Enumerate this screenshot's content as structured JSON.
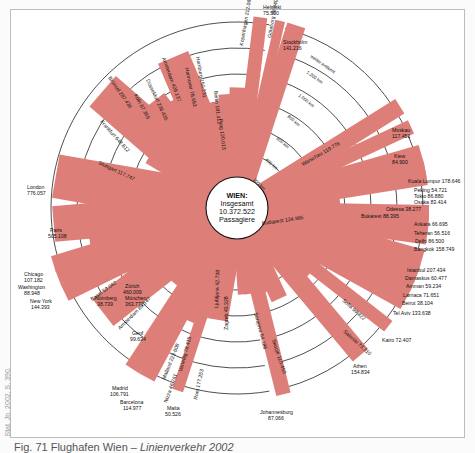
{
  "figure": {
    "caption_number": "Fig. 71",
    "caption_title": "Flughafen Wien –",
    "caption_subtitle": "Linienverkehr 2002",
    "source": "Stat. Jb. 2002, S. 390.",
    "center_title": "WIEN:",
    "center_line2": "Insgesamt",
    "center_total": "10.372.522",
    "center_line4": "Passagiere",
    "bar_color": "#dd7f78"
  },
  "chart_data": {
    "type": "radial-bar",
    "title": "Flughafen Wien – Linienverkehr 2002",
    "center": {
      "city": "WIEN",
      "label": "Insgesamt",
      "total_passengers": 10372522
    },
    "distance_rings_km": [
      200,
      400,
      600,
      800,
      1000,
      1200
    ],
    "ring_labels": [
      "200 km",
      "400 km",
      "600 km",
      "800 km",
      "1.000 km",
      "1.200 km",
      "weiter entfernt"
    ],
    "value_label": "Passagiere",
    "destinations": [
      {
        "city": "Helsinki",
        "passengers": 75500,
        "angle": 83
      },
      {
        "city": "Göteborg",
        "passengers": 38840,
        "angle": 77
      },
      {
        "city": "Stockholm",
        "passengers": 141216,
        "angle": 72
      },
      {
        "city": "Kopenhagen",
        "passengers": 212067,
        "angle": 88
      },
      {
        "city": "Berlin",
        "passengers": 181412,
        "angle": 94
      },
      {
        "city": "Prag",
        "passengers": 120013,
        "angle": 99
      },
      {
        "city": "Hamburg",
        "passengers": 150231,
        "angle": 104
      },
      {
        "city": "Hannover",
        "passengers": 78693,
        "angle": 107
      },
      {
        "city": "Amsterdam",
        "passengers": 428137,
        "angle": 113
      },
      {
        "city": "Düsseldorf",
        "passengers": 236435,
        "angle": 119
      },
      {
        "city": "Köln",
        "passengers": 87365,
        "angle": 123
      },
      {
        "city": "Brüssel",
        "passengers": 287436,
        "angle": 128
      },
      {
        "city": "Frankfurt",
        "passengers": 648612,
        "angle": 139
      },
      {
        "city": "Stuttgart",
        "passengers": 117747,
        "angle": 149
      },
      {
        "city": "London",
        "passengers": 776057,
        "angle": 170
      },
      {
        "city": "Paris",
        "passengers": 505108,
        "angle": 185
      },
      {
        "city": "Nürnberg",
        "passengers": 38739,
        "angle": 193
      },
      {
        "city": "München",
        "passengers": 363771,
        "angle": 190
      },
      {
        "city": "Chicago",
        "passengers": 107182,
        "angle": 197
      },
      {
        "city": "Washington",
        "passengers": 88948,
        "angle": 201
      },
      {
        "city": "New York",
        "passengers": 144393,
        "angle": 206
      },
      {
        "city": "Basel",
        "passengers": 59042,
        "angle": 210
      },
      {
        "city": "Zürich",
        "passengers": 460009,
        "angle": 218
      },
      {
        "city": "Amsterdam",
        "passengers": 89547,
        "angle": 224
      },
      {
        "city": "Genf",
        "passengers": 99634,
        "angle": 229
      },
      {
        "city": "Madrid",
        "passengers": 106791,
        "angle": 237
      },
      {
        "city": "Barcelona",
        "passengers": 114977,
        "angle": 242
      },
      {
        "city": "Mailand",
        "passengers": 223608,
        "angle": 246
      },
      {
        "city": "Nizza",
        "passengers": 46761,
        "angle": 249
      },
      {
        "city": "Malta",
        "passengers": 50526,
        "angle": 252
      },
      {
        "city": "Venedig",
        "passengers": 78415,
        "angle": 256
      },
      {
        "city": "Rom",
        "passengers": 177253,
        "angle": 260
      },
      {
        "city": "Ljubljana",
        "passengers": 42738,
        "angle": 274
      },
      {
        "city": "Zagreb",
        "passengers": 43328,
        "angle": 279
      },
      {
        "city": "Johannesburg",
        "passengers": 87066,
        "angle": 284
      },
      {
        "city": "Sarajevo",
        "passengers": 54186,
        "angle": 289
      },
      {
        "city": "Skopje",
        "passengers": 110450,
        "angle": 295
      },
      {
        "city": "Athen",
        "passengers": 154834,
        "angle": 310
      },
      {
        "city": "Saloniki",
        "passengers": 73310,
        "angle": 314
      },
      {
        "city": "Sofia",
        "passengers": 99822,
        "angle": 319
      },
      {
        "city": "Kairo",
        "passengers": 72407,
        "angle": 322
      },
      {
        "city": "Tel Aviv",
        "passengers": 133638,
        "angle": 331
      },
      {
        "city": "Beirut",
        "passengers": 38104,
        "angle": 334
      },
      {
        "city": "Larnaca",
        "passengers": 71651,
        "angle": 336
      },
      {
        "city": "Amman",
        "passengers": 59234,
        "angle": 339
      },
      {
        "city": "Damaskus",
        "passengers": 60477,
        "angle": 341
      },
      {
        "city": "Istanbul",
        "passengers": 207434,
        "angle": 344
      },
      {
        "city": "Bangkok",
        "passengers": 158749,
        "angle": 352
      },
      {
        "city": "Delhi",
        "passengers": 86500,
        "angle": 355
      },
      {
        "city": "Teheran",
        "passengers": 56516,
        "angle": 357
      },
      {
        "city": "Ankara",
        "passengers": 66695,
        "angle": 359
      },
      {
        "city": "Bukarest",
        "passengers": 88395,
        "angle": 3
      },
      {
        "city": "Budapest",
        "passengers": 124985,
        "angle": 7
      },
      {
        "city": "Odessa",
        "passengers": 38277,
        "angle": 5
      },
      {
        "city": "Osaka",
        "passengers": 83414,
        "angle": 9
      },
      {
        "city": "Tokio",
        "passengers": 86880,
        "angle": 11
      },
      {
        "city": "Peking",
        "passengers": 54721,
        "angle": 13
      },
      {
        "city": "Kuala Lumpur",
        "passengers": 178646,
        "angle": 16
      },
      {
        "city": "Kiew",
        "passengers": 84900,
        "angle": 25
      },
      {
        "city": "Warschau",
        "passengers": 119776,
        "angle": 32
      },
      {
        "city": "Moskau",
        "passengers": 117451,
        "angle": 32
      }
    ]
  },
  "labels": [
    {
      "t": "Helsinki",
      "x": 263,
      "y": 9
    },
    {
      "t": "75.500",
      "x": 263,
      "y": 15
    },
    {
      "t": "Stockholm",
      "x": 283,
      "y": 44
    },
    {
      "t": "141.216",
      "x": 283,
      "y": 50
    },
    {
      "t": "London",
      "x": 27,
      "y": 189
    },
    {
      "t": "776.057",
      "x": 27,
      "y": 195
    },
    {
      "t": "Paris",
      "x": 50,
      "y": 232
    },
    {
      "t": "505.108",
      "x": 48,
      "y": 238
    },
    {
      "t": "Nürnberg",
      "x": 95,
      "y": 300
    },
    {
      "t": "38.739",
      "x": 97,
      "y": 306
    },
    {
      "t": "München",
      "x": 125,
      "y": 300
    },
    {
      "t": "363.771",
      "x": 125,
      "y": 306
    },
    {
      "t": "Chicago",
      "x": 24,
      "y": 276
    },
    {
      "t": "107.182",
      "x": 24,
      "y": 282
    },
    {
      "t": "Washington",
      "x": 18,
      "y": 289
    },
    {
      "t": "88.948",
      "x": 24,
      "y": 295
    },
    {
      "t": "New York",
      "x": 30,
      "y": 303
    },
    {
      "t": "144.393",
      "x": 31,
      "y": 309
    },
    {
      "t": "Zürich",
      "x": 125,
      "y": 288
    },
    {
      "t": "460.009",
      "x": 123,
      "y": 294
    },
    {
      "t": "Genf",
      "x": 132,
      "y": 335
    },
    {
      "t": "99.634",
      "x": 130,
      "y": 341
    },
    {
      "t": "Madrid",
      "x": 112,
      "y": 390
    },
    {
      "t": "106.791",
      "x": 110,
      "y": 396
    },
    {
      "t": "Barcelona",
      "x": 120,
      "y": 404
    },
    {
      "t": "114.977",
      "x": 123,
      "y": 410
    },
    {
      "t": "Malta",
      "x": 167,
      "y": 410
    },
    {
      "t": "50.526",
      "x": 165,
      "y": 416
    },
    {
      "t": "Johannesburg",
      "x": 260,
      "y": 414
    },
    {
      "t": "87.066",
      "x": 268,
      "y": 420
    },
    {
      "t": "Athen",
      "x": 353,
      "y": 368
    },
    {
      "t": "154.834",
      "x": 351,
      "y": 374
    },
    {
      "t": "Kairo 72.407",
      "x": 382,
      "y": 342
    },
    {
      "t": "Tel Aviv 133.638",
      "x": 393,
      "y": 315
    },
    {
      "t": "Beirut 38.104",
      "x": 402,
      "y": 305
    },
    {
      "t": "Larnaca 71.651",
      "x": 403,
      "y": 297
    },
    {
      "t": "Amman 59.234",
      "x": 406,
      "y": 288
    },
    {
      "t": "Damaskus 60.477",
      "x": 405,
      "y": 280
    },
    {
      "t": "Istanbul 207.434",
      "x": 407,
      "y": 272
    },
    {
      "t": "Bangkok 158.749",
      "x": 414,
      "y": 251
    },
    {
      "t": "Delhi 86.500",
      "x": 415,
      "y": 243
    },
    {
      "t": "Teheran 56.516",
      "x": 414,
      "y": 235
    },
    {
      "t": "Ankara 66.695",
      "x": 414,
      "y": 226
    },
    {
      "t": "Bukarest 88.395",
      "x": 361,
      "y": 218
    },
    {
      "t": "Odessa 38.277",
      "x": 386,
      "y": 211
    },
    {
      "t": "Osaka 83.414",
      "x": 414,
      "y": 204
    },
    {
      "t": "Tokio 86.880",
      "x": 414,
      "y": 198
    },
    {
      "t": "Peking 54.721",
      "x": 414,
      "y": 192
    },
    {
      "t": "Kuala Lumpur 178.646",
      "x": 408,
      "y": 183
    },
    {
      "t": "Kiew",
      "x": 394,
      "y": 158
    },
    {
      "t": "84.900",
      "x": 392,
      "y": 164
    },
    {
      "t": "Moskau",
      "x": 392,
      "y": 132
    },
    {
      "t": "117.451",
      "x": 392,
      "y": 138
    }
  ],
  "rot_labels": [
    {
      "t": "Kopenhagen 212.067",
      "x": 243,
      "y": 46,
      "r": -80
    },
    {
      "t": "Göteborg 38.840",
      "x": 271,
      "y": 38,
      "r": -80
    },
    {
      "t": "Berlin 181.412",
      "x": 214,
      "y": 91,
      "r": 84
    },
    {
      "t": "Prag 120.013",
      "x": 219,
      "y": 119,
      "r": 84
    },
    {
      "t": "Hamburg 150.231",
      "x": 196,
      "y": 57,
      "r": 80
    },
    {
      "t": "Hannover 78.693",
      "x": 185,
      "y": 68,
      "r": 78
    },
    {
      "t": "Amsterdam 428.137",
      "x": 162,
      "y": 58,
      "r": 70
    },
    {
      "t": "Düsseldorf 236.435",
      "x": 146,
      "y": 80,
      "r": 65
    },
    {
      "t": "Köln 87.365",
      "x": 134,
      "y": 95,
      "r": 62
    },
    {
      "t": "Brüssel 287.436",
      "x": 108,
      "y": 78,
      "r": 55
    },
    {
      "t": "Frankfurt 648.612",
      "x": 100,
      "y": 122,
      "r": 48
    },
    {
      "t": "Stuttgart 117.747",
      "x": 98,
      "y": 164,
      "r": 25
    },
    {
      "t": "Basel 59.042",
      "x": 92,
      "y": 301,
      "r": -35
    },
    {
      "t": "Amsterdam 89.547",
      "x": 120,
      "y": 330,
      "r": -45
    },
    {
      "t": "Mailand 223.608",
      "x": 165,
      "y": 380,
      "r": -68
    },
    {
      "t": "Nizza 46.761",
      "x": 167,
      "y": 403,
      "r": -70
    },
    {
      "t": "Venedig 78.415",
      "x": 182,
      "y": 372,
      "r": -75
    },
    {
      "t": "Rom 177.253",
      "x": 197,
      "y": 400,
      "r": -78
    },
    {
      "t": "Ljubljana 42.738",
      "x": 218,
      "y": 308,
      "r": -88
    },
    {
      "t": "Zagreb 43.328",
      "x": 228,
      "y": 330,
      "r": -90
    },
    {
      "t": "Sarajevo 54.186",
      "x": 254,
      "y": 313,
      "r": 75
    },
    {
      "t": "Skopje 110.450",
      "x": 272,
      "y": 340,
      "r": 72
    },
    {
      "t": "Sofia 99.822",
      "x": 342,
      "y": 301,
      "r": 42
    },
    {
      "t": "Saloniki 73.310",
      "x": 343,
      "y": 332,
      "r": 42
    },
    {
      "t": "Budapest 124.985",
      "x": 262,
      "y": 225,
      "r": -8
    },
    {
      "t": "Warschau 119.776",
      "x": 303,
      "y": 166,
      "r": -30
    }
  ],
  "ring_text": [
    {
      "t": "weiter entfernt",
      "x": 310,
      "y": 57,
      "r": 35
    },
    {
      "t": "1.200 km",
      "x": 306,
      "y": 73,
      "r": 35
    },
    {
      "t": "1.000 km",
      "x": 298,
      "y": 96,
      "r": 38
    },
    {
      "t": "800 km",
      "x": 287,
      "y": 117,
      "r": 40
    },
    {
      "t": "600 km",
      "x": 276,
      "y": 139,
      "r": 40
    },
    {
      "t": "400 km",
      "x": 265,
      "y": 160,
      "r": 42
    },
    {
      "t": "200 km",
      "x": 253,
      "y": 180,
      "r": 45
    }
  ]
}
